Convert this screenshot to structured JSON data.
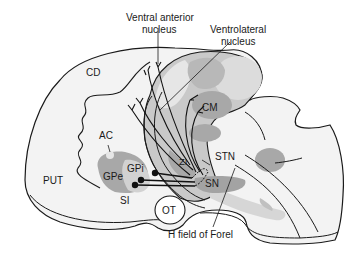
{
  "diagram": {
    "type": "anatomical-illustration",
    "labels": {
      "ventral_anterior_line1": "Ventral anterior",
      "ventral_anterior_line2": "nucleus",
      "ventrolateral_line1": "Ventrolateral",
      "ventrolateral_line2": "nucleus",
      "cd": "CD",
      "cm": "CM",
      "ac": "AC",
      "zi": "ZI",
      "stn": "STN",
      "put": "PUT",
      "gpi": "GPi",
      "gpe": "GPe",
      "sn": "SN",
      "si": "SI",
      "ot": "OT",
      "h_field": "H field of Forel"
    },
    "colors": {
      "outline": "#1a1a1a",
      "light_fill": "#f1f1f1",
      "mid_fill": "#c8c8c8",
      "dark_fill": "#a3a3a3",
      "thalamus_fill": "#d9d9d9",
      "background": "#ffffff"
    }
  }
}
